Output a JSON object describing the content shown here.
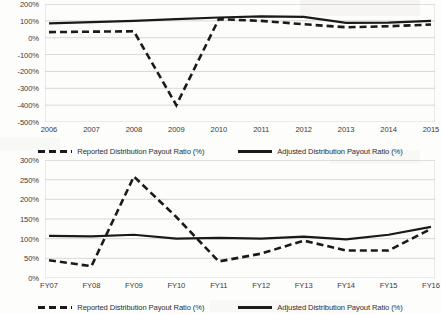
{
  "document": {
    "type": "scanned-figure-page",
    "charts_count": 2
  },
  "chart_data": [
    {
      "id": "top",
      "type": "line",
      "title": "",
      "xlabel": "",
      "ylabel": "",
      "categories": [
        "2006",
        "2007",
        "2008",
        "2009",
        "2010",
        "2011",
        "2012",
        "2013",
        "2014",
        "2015"
      ],
      "ylim": [
        -500,
        200
      ],
      "yticks": [
        200,
        100,
        0,
        -100,
        -200,
        -300,
        -400,
        -500
      ],
      "ytick_labels": [
        "200%",
        "100%",
        "0%",
        "-100%",
        "-200%",
        "-300%",
        "-400%",
        "-500%"
      ],
      "grid": true,
      "legend_position": "bottom",
      "series": [
        {
          "name": "Reported Distribution Payout Ratio (%)",
          "style": "dashed",
          "color": "#1a1a1a",
          "values": [
            33,
            36,
            38,
            -400,
            110,
            100,
            80,
            62,
            68,
            78
          ]
        },
        {
          "name": "Adjusted Distribution Payout Ratio (%)",
          "style": "solid",
          "color": "#1a1a1a",
          "values": [
            85,
            93,
            100,
            110,
            120,
            127,
            124,
            88,
            90,
            100
          ]
        }
      ]
    },
    {
      "id": "bottom",
      "type": "line",
      "title": "",
      "xlabel": "",
      "ylabel": "",
      "categories": [
        "FY07",
        "FY08",
        "FY09",
        "FY10",
        "FY11",
        "FY12",
        "FY13",
        "FY14",
        "FY15",
        "FY16"
      ],
      "ylim": [
        0,
        300
      ],
      "yticks": [
        300,
        250,
        200,
        150,
        100,
        50,
        0
      ],
      "ytick_labels": [
        "300%",
        "250%",
        "200%",
        "150%",
        "100%",
        "50%",
        "0%"
      ],
      "grid": true,
      "legend_position": "bottom",
      "series": [
        {
          "name": "Reported Distribution Payout Ratio (%)",
          "style": "dashed",
          "color": "#1a1a1a",
          "values": [
            45,
            30,
            258,
            155,
            42,
            62,
            95,
            70,
            70,
            125
          ]
        },
        {
          "name": "Adjusted Distribution Payout Ratio (%)",
          "style": "solid",
          "color": "#1a1a1a",
          "values": [
            107,
            106,
            110,
            100,
            102,
            100,
            105,
            98,
            110,
            130
          ]
        }
      ]
    }
  ],
  "legend": {
    "reported_label": "Reported Distribution Payout Ratio (%)",
    "adjusted_label": "Adjusted Distribution Payout Ratio (%)"
  }
}
